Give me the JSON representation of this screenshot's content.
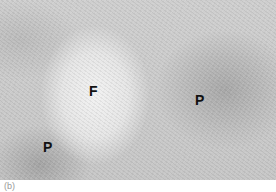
{
  "figure": {
    "labels": [
      {
        "id": "follicle",
        "text": "F"
      },
      {
        "id": "paracortex-right",
        "text": "P"
      },
      {
        "id": "paracortex-left",
        "text": "P"
      }
    ],
    "caption": "(b)"
  }
}
